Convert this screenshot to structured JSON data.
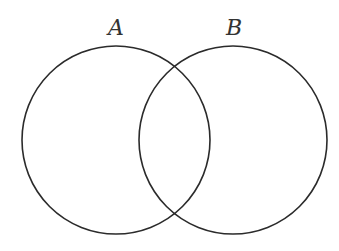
{
  "diagram": {
    "type": "venn",
    "sets": [
      {
        "label": "A",
        "cx": 116,
        "cy": 140,
        "r": 94
      },
      {
        "label": "B",
        "cx": 233,
        "cy": 140,
        "r": 94
      }
    ],
    "colors": {
      "stroke": "#2b2b2b",
      "label": "#333333",
      "background": "#ffffff"
    }
  }
}
